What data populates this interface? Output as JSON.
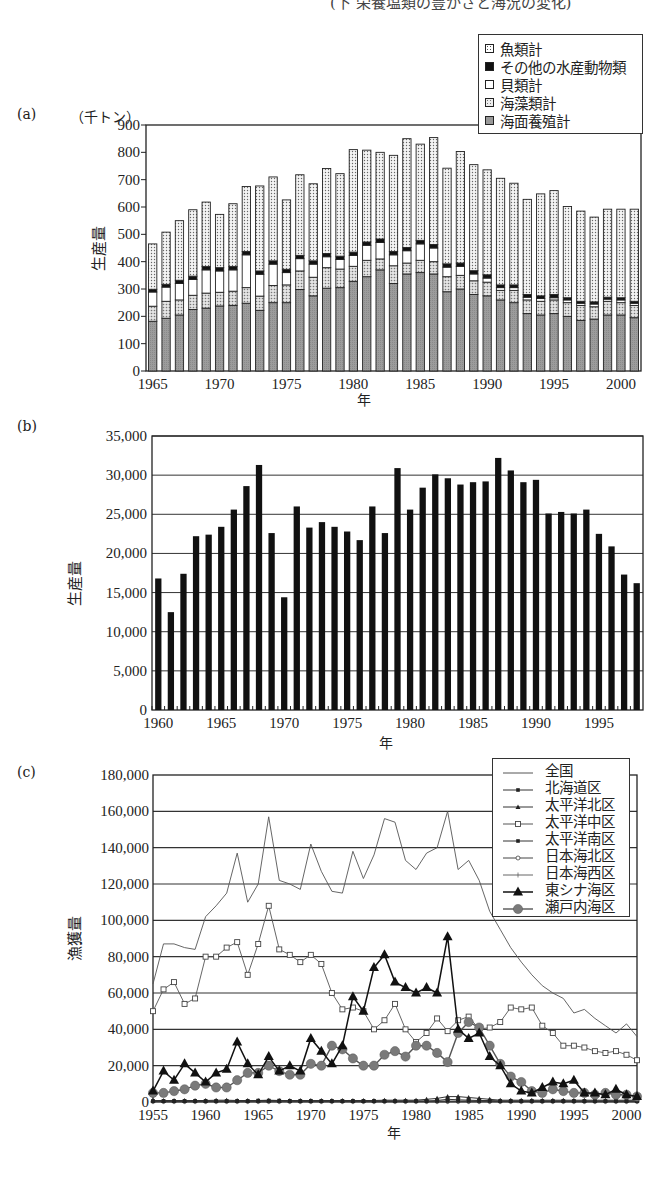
{
  "page": {
    "header_partial": "(下 栄養塩類の豊かさと海況の変化)"
  },
  "panels": {
    "a": {
      "label": "(a)",
      "unit": "（千トン）",
      "ylabel": "生産量",
      "xlabel": "年"
    },
    "b": {
      "label": "(b)",
      "ylabel": "生産量",
      "xlabel": "年"
    },
    "c": {
      "label": "(c)",
      "ylabel": "漁獲量",
      "xlabel": "年"
    }
  },
  "legend_a": [
    {
      "label": "魚類計",
      "swatch": "dots"
    },
    {
      "label": "その他の水産動物類",
      "swatch": "black"
    },
    {
      "label": "貝類計",
      "swatch": "white"
    },
    {
      "label": "海藻類計",
      "swatch": "dots2"
    },
    {
      "label": "海面養殖計",
      "swatch": "gray"
    }
  ],
  "legend_c": [
    {
      "label": "全国",
      "marker": "none"
    },
    {
      "label": "北海道区",
      "marker": "small-square-filled"
    },
    {
      "label": "太平洋北区",
      "marker": "small-triangle-filled"
    },
    {
      "label": "太平洋中区",
      "marker": "square-open"
    },
    {
      "label": "太平洋南区",
      "marker": "small-square-filled"
    },
    {
      "label": "日本海北区",
      "marker": "circle-open"
    },
    {
      "label": "日本海西区",
      "marker": "plus"
    },
    {
      "label": "東シナ海区",
      "marker": "triangle-filled-large"
    },
    {
      "label": "瀬戸内海区",
      "marker": "circle-filled-gray"
    }
  ],
  "colors": {
    "axis": "#222222",
    "grid": "#333333",
    "bar_black": "#111111",
    "aquaculture_gray": "#9a9a9a",
    "seaweed_fill": "#ececec",
    "fish_fill": "#f2f2f2",
    "setouchi_gray": "#777777"
  },
  "chart_data": [
    {
      "id": "a",
      "type": "bar",
      "stacked": true,
      "title": "",
      "xlabel": "年",
      "ylabel": "生産量",
      "unit": "千トン",
      "ylim": [
        0,
        900
      ],
      "yticks": [
        0,
        100,
        200,
        300,
        400,
        500,
        600,
        700,
        800,
        900
      ],
      "xtick_labels": [
        "1965",
        "1970",
        "1975",
        "1980",
        "1985",
        "1990",
        "1995",
        "2000"
      ],
      "grid": false,
      "legend_position": "top-right",
      "categories": [
        1965,
        1966,
        1967,
        1968,
        1969,
        1970,
        1971,
        1972,
        1973,
        1974,
        1975,
        1976,
        1977,
        1978,
        1979,
        1980,
        1981,
        1982,
        1983,
        1984,
        1985,
        1986,
        1987,
        1988,
        1989,
        1990,
        1991,
        1992,
        1993,
        1994,
        1995,
        1996,
        1997,
        1998,
        1999,
        2000,
        2001
      ],
      "series": [
        {
          "name": "海面養殖計",
          "values": [
            182,
            193,
            205,
            225,
            230,
            238,
            240,
            248,
            222,
            250,
            250,
            298,
            275,
            303,
            305,
            328,
            345,
            370,
            320,
            355,
            360,
            355,
            290,
            300,
            280,
            275,
            260,
            250,
            210,
            205,
            210,
            200,
            185,
            190,
            205,
            205,
            195
          ]
        },
        {
          "name": "海藻類計",
          "values": [
            55,
            62,
            55,
            52,
            55,
            50,
            52,
            57,
            52,
            63,
            65,
            68,
            68,
            75,
            68,
            55,
            60,
            40,
            65,
            40,
            45,
            45,
            55,
            50,
            50,
            50,
            35,
            45,
            50,
            50,
            50,
            50,
            55,
            45,
            50,
            45,
            45
          ]
        },
        {
          "name": "貝類計",
          "values": [
            52,
            52,
            60,
            58,
            85,
            78,
            78,
            120,
            80,
            78,
            45,
            45,
            48,
            40,
            35,
            40,
            55,
            60,
            40,
            45,
            60,
            50,
            35,
            33,
            25,
            15,
            10,
            10,
            10,
            10,
            8,
            10,
            8,
            10,
            8,
            10,
            8
          ]
        },
        {
          "name": "その他の水産動物類",
          "values": [
            10,
            10,
            12,
            12,
            12,
            12,
            12,
            12,
            12,
            12,
            12,
            12,
            12,
            12,
            12,
            12,
            12,
            13,
            12,
            12,
            13,
            13,
            12,
            12,
            12,
            12,
            10,
            10,
            10,
            10,
            12,
            8,
            7,
            8,
            7,
            8,
            7
          ]
        },
        {
          "name": "魚類計",
          "values": [
            166,
            191,
            218,
            243,
            236,
            195,
            230,
            238,
            311,
            307,
            254,
            295,
            282,
            311,
            302,
            375,
            336,
            317,
            352,
            398,
            352,
            391,
            350,
            408,
            388,
            384,
            390,
            372,
            348,
            373,
            380,
            334,
            330,
            310,
            322,
            324,
            337
          ]
        }
      ],
      "totals": [
        465,
        508,
        550,
        590,
        618,
        573,
        612,
        675,
        677,
        710,
        626,
        718,
        685,
        741,
        722,
        808,
        808,
        800,
        789,
        850,
        830,
        854,
        742,
        803,
        755,
        736,
        705,
        687,
        628,
        648,
        660,
        602,
        585,
        563,
        592,
        592,
        592
      ]
    },
    {
      "id": "b",
      "type": "bar",
      "title": "",
      "xlabel": "年",
      "ylabel": "生産量",
      "ylim": [
        0,
        35000
      ],
      "yticks": [
        0,
        5000,
        10000,
        15000,
        20000,
        25000,
        30000,
        35000
      ],
      "ytick_labels": [
        "0",
        "5,000",
        "10,000",
        "15,000",
        "20,000",
        "25,000",
        "30,000",
        "35,000"
      ],
      "xtick_labels": [
        "1960",
        "1965",
        "1970",
        "1975",
        "1980",
        "1985",
        "1990",
        "1995"
      ],
      "grid": true,
      "categories": [
        1960,
        1961,
        1962,
        1963,
        1964,
        1965,
        1966,
        1967,
        1968,
        1969,
        1970,
        1971,
        1972,
        1973,
        1974,
        1975,
        1976,
        1977,
        1978,
        1979,
        1980,
        1981,
        1982,
        1983,
        1984,
        1985,
        1986,
        1987,
        1988,
        1989,
        1990,
        1991,
        1992,
        1993,
        1994,
        1995,
        1996,
        1997,
        1998
      ],
      "values": [
        16800,
        12500,
        17400,
        22200,
        22400,
        23400,
        25600,
        28600,
        31300,
        22600,
        14400,
        26000,
        23300,
        24000,
        23400,
        22800,
        21700,
        26000,
        22600,
        30900,
        25600,
        28400,
        30100,
        29600,
        28800,
        29100,
        29200,
        32200,
        30600,
        29100,
        29400,
        25100,
        25300,
        25100,
        25600,
        22500,
        20900,
        17300,
        16200
      ]
    },
    {
      "id": "c",
      "type": "line",
      "title": "",
      "xlabel": "年",
      "ylabel": "漁獲量",
      "ylim": [
        0,
        180000
      ],
      "yticks": [
        0,
        20000,
        40000,
        60000,
        80000,
        100000,
        120000,
        140000,
        160000,
        180000
      ],
      "ytick_labels": [
        "0",
        "20,000",
        "40,000",
        "60,000",
        "80,000",
        "100,000",
        "120,000",
        "140,000",
        "160,000",
        "180,000"
      ],
      "xtick_labels": [
        "1955",
        "1960",
        "1965",
        "1970",
        "1975",
        "1980",
        "1985",
        "1990",
        "1995",
        "2000"
      ],
      "grid": true,
      "legend_position": "top-right",
      "x": [
        1955,
        1956,
        1957,
        1958,
        1959,
        1960,
        1961,
        1962,
        1963,
        1964,
        1965,
        1966,
        1967,
        1968,
        1969,
        1970,
        1971,
        1972,
        1973,
        1974,
        1975,
        1976,
        1977,
        1978,
        1979,
        1980,
        1981,
        1982,
        1983,
        1984,
        1985,
        1986,
        1987,
        1988,
        1989,
        1990,
        1991,
        1992,
        1993,
        1994,
        1995,
        1996,
        1997,
        1998,
        1999,
        2000,
        2001
      ],
      "series": [
        {
          "name": "全国",
          "values": [
            65000,
            87000,
            87000,
            85000,
            84000,
            102000,
            108000,
            115000,
            137000,
            110000,
            120000,
            157000,
            122000,
            120000,
            117000,
            142000,
            127000,
            116000,
            115000,
            138000,
            123000,
            136000,
            156000,
            154000,
            133000,
            128000,
            137000,
            140000,
            160000,
            128000,
            133000,
            122000,
            105000,
            95000,
            85000,
            77000,
            70000,
            64000,
            60000,
            57000,
            49000,
            51000,
            46000,
            42000,
            38000,
            43000,
            36000,
            31000
          ]
        },
        {
          "name": "北海道区",
          "values": [
            500,
            500,
            500,
            500,
            500,
            500,
            500,
            500,
            500,
            500,
            800,
            800,
            800,
            600,
            500,
            500,
            500,
            500,
            500,
            500,
            500,
            500,
            500,
            500,
            500,
            500,
            500,
            800,
            1500,
            1200,
            1000,
            800,
            800,
            500,
            500,
            500,
            500,
            500,
            500,
            500,
            500,
            500,
            500,
            500,
            500,
            500,
            500
          ]
        },
        {
          "name": "太平洋北区",
          "values": [
            800,
            800,
            800,
            800,
            800,
            800,
            1000,
            1000,
            800,
            800,
            800,
            1000,
            800,
            800,
            800,
            800,
            800,
            800,
            800,
            800,
            800,
            800,
            1000,
            1000,
            1000,
            1000,
            1500,
            2000,
            3000,
            3000,
            2500,
            2000,
            1500,
            1000,
            1000,
            1000,
            1000,
            1000,
            1000,
            1000,
            1000,
            1000,
            1000,
            1000,
            1000,
            1000,
            1000
          ]
        },
        {
          "name": "太平洋中区",
          "values": [
            50000,
            62000,
            66000,
            54000,
            57000,
            80000,
            80000,
            85000,
            88000,
            70000,
            87000,
            108000,
            84000,
            81000,
            77000,
            81000,
            76000,
            60000,
            51000,
            52000,
            50000,
            40000,
            45000,
            54000,
            40000,
            33000,
            38000,
            46000,
            39000,
            45000,
            47000,
            40000,
            41000,
            44000,
            52000,
            51000,
            52000,
            42000,
            38000,
            31000,
            31000,
            30000,
            28000,
            27000,
            28000,
            26000,
            23000
          ]
        },
        {
          "name": "太平洋南区",
          "values": [
            500,
            500,
            500,
            500,
            500,
            500,
            500,
            500,
            500,
            500,
            500,
            500,
            500,
            500,
            500,
            500,
            500,
            500,
            500,
            500,
            500,
            500,
            500,
            500,
            500,
            500,
            500,
            500,
            500,
            500,
            500,
            500,
            500,
            500,
            500,
            500,
            500,
            500,
            500,
            500,
            500,
            500,
            500,
            500,
            500,
            500,
            500
          ]
        },
        {
          "name": "日本海北区",
          "values": [
            300,
            300,
            300,
            300,
            300,
            300,
            300,
            300,
            300,
            300,
            300,
            300,
            300,
            300,
            300,
            300,
            300,
            300,
            300,
            300,
            300,
            300,
            300,
            300,
            300,
            300,
            300,
            300,
            300,
            300,
            300,
            300,
            300,
            300,
            300,
            300,
            300,
            300,
            300,
            300,
            300,
            300,
            300,
            300,
            300,
            300,
            300
          ]
        },
        {
          "name": "日本海西区",
          "values": [
            200,
            200,
            200,
            200,
            200,
            200,
            200,
            200,
            200,
            200,
            200,
            200,
            200,
            200,
            200,
            200,
            200,
            200,
            200,
            200,
            200,
            200,
            200,
            200,
            200,
            200,
            200,
            200,
            200,
            200,
            200,
            200,
            200,
            200,
            200,
            200,
            200,
            200,
            200,
            200,
            200,
            200,
            200,
            200,
            200,
            200,
            200
          ]
        },
        {
          "name": "東シナ海区",
          "values": [
            6000,
            17000,
            12000,
            21000,
            16000,
            11000,
            16000,
            18000,
            33000,
            21000,
            15000,
            25000,
            17000,
            20000,
            17000,
            35000,
            28000,
            21000,
            31000,
            58000,
            50000,
            74000,
            81000,
            66000,
            63000,
            60000,
            63000,
            60000,
            91000,
            40000,
            35000,
            38000,
            25000,
            20000,
            10000,
            6000,
            5000,
            8000,
            11000,
            10000,
            12000,
            5000,
            5000,
            4000,
            7000,
            4000,
            3000
          ]
        },
        {
          "name": "瀬戸内海区",
          "values": [
            5000,
            5000,
            6000,
            7000,
            9000,
            10000,
            8000,
            8000,
            12000,
            16000,
            16000,
            20000,
            17000,
            15000,
            15000,
            21000,
            20000,
            31000,
            29000,
            24000,
            20000,
            20000,
            26000,
            28000,
            25000,
            31000,
            31000,
            27000,
            22000,
            38000,
            44000,
            41000,
            31000,
            21000,
            14000,
            11000,
            6000,
            5000,
            7000,
            6000,
            5000,
            5000,
            4000,
            5000,
            4000,
            4000,
            3000
          ]
        }
      ]
    }
  ]
}
